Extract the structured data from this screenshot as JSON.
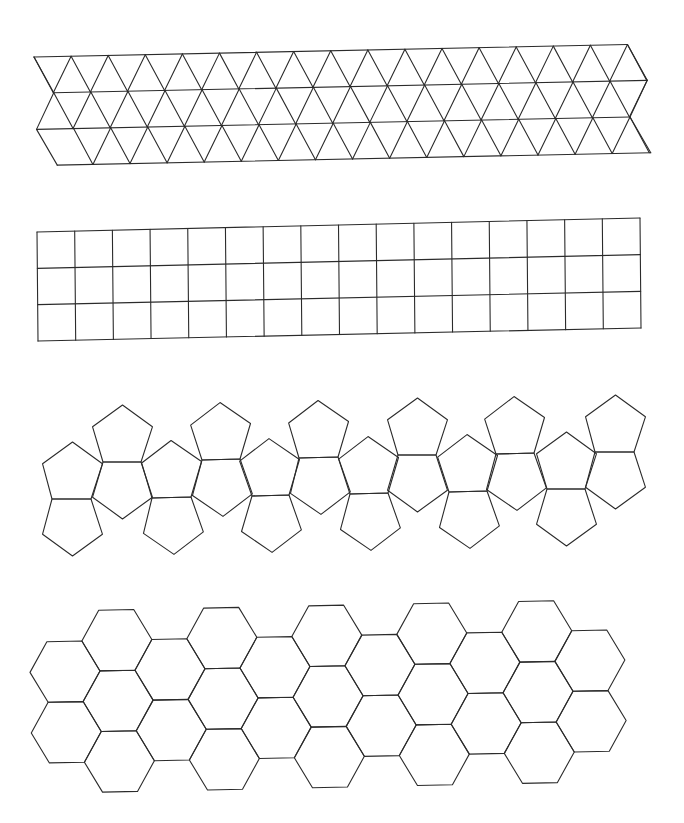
{
  "canvas": {
    "width": 684,
    "height": 823,
    "background": "#ffffff",
    "stroke": "#2b2b2b"
  },
  "figures": [
    {
      "id": "triangle-strip",
      "name": "Triangular grid strip",
      "rows": 3,
      "top_vertices": 17,
      "origin": [
        34,
        57
      ],
      "side": 37.1,
      "row_height": 36.2,
      "rotation_deg": -1.2,
      "boundary_offsets": [
        0,
        19,
        1,
        21
      ]
    },
    {
      "id": "square-strip",
      "name": "Square grid strip",
      "rows": 3,
      "columns": 16,
      "corners": {
        "top_left": [
          37,
          232
        ],
        "top_right": [
          640,
          218
        ],
        "bottom_left": [
          38,
          341
        ],
        "bottom_right": [
          641,
          328
        ]
      }
    },
    {
      "id": "pentagon-strip",
      "name": "Pentagon net strip (dodecahedron-style)",
      "side": 37,
      "pairs": 6,
      "start": [
        56,
        498
      ],
      "direction_deg": -1.2
    },
    {
      "id": "hexagon-strip",
      "name": "Hexagonal grid strip",
      "side": 35,
      "columns": 11,
      "rows": 2,
      "origin": [
        48,
        672
      ],
      "rotation_deg": -1.2
    }
  ]
}
